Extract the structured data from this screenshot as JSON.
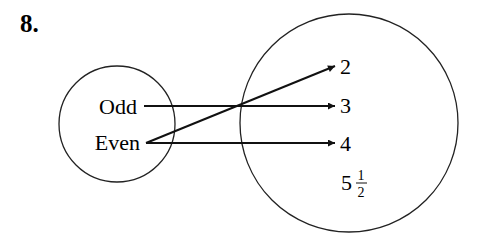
{
  "problem_number": "8.",
  "domain_set": {
    "items": [
      "Odd",
      "Even"
    ]
  },
  "range_set": {
    "items": [
      "2",
      "3",
      "4",
      "5"
    ],
    "fraction": {
      "numerator": "1",
      "denominator": "2"
    }
  },
  "mappings": [
    {
      "from": "Odd",
      "to": "3"
    },
    {
      "from": "Even",
      "to": "2"
    },
    {
      "from": "Even",
      "to": "4"
    }
  ]
}
